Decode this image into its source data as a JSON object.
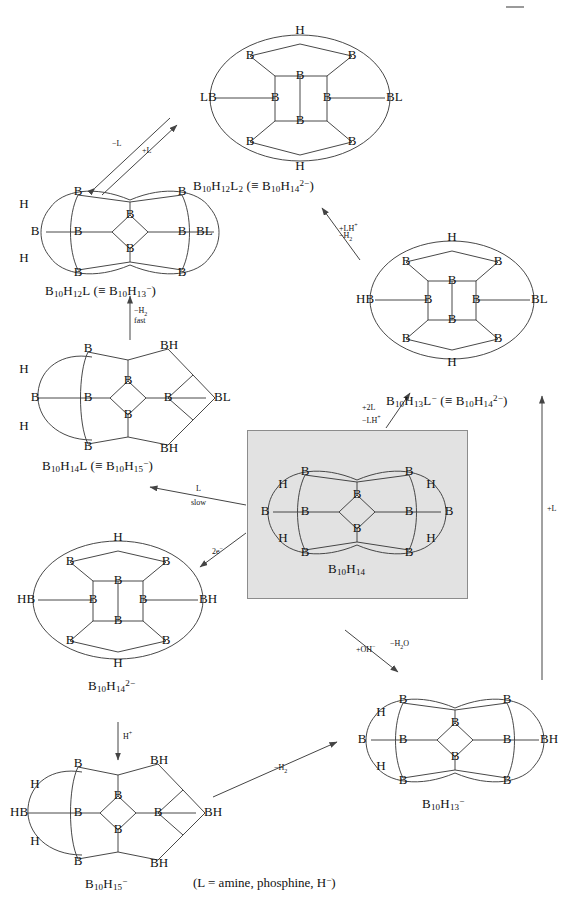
{
  "diagram": {
    "legend": "(L = amine, phosphine, H−)",
    "legend_parts": {
      "prefix": "(L = amine, phosphine, H",
      "sup": "−",
      "suffix": ")"
    },
    "highlight_color": "#e2e2e2",
    "line_color": "#333333",
    "background": "#ffffff"
  },
  "species": [
    {
      "id": "b10h12l2",
      "name": "B10H12L2",
      "label_main": "B₁₀H₁₂L₂",
      "label_equiv": "(≡ B₁₀H₁₄²⁻)",
      "formula_html": "B<sub>10</sub>H<sub>12</sub>L<sub>2</sub> (≡ B<sub>10</sub>H<sub>14</sub><sup>2−</sup>)",
      "cage_type": "ellipse",
      "exterior_atoms": [
        "H",
        "B",
        "B",
        "LB",
        "BL",
        "B",
        "B",
        "H"
      ],
      "x": 193,
      "y": 185
    },
    {
      "id": "b10h12l",
      "name": "B10H12L",
      "formula_html": "B<sub>10</sub>H<sub>12</sub>L (≡ B<sub>10</sub>H<sub>13</sub><sup>−</sup>)",
      "cage_type": "peanut",
      "x": 45,
      "y": 285
    },
    {
      "id": "b10h14l",
      "name": "B10H14L",
      "formula_html": "B<sub>10</sub>H<sub>14</sub>L (≡ B<sub>10</sub>H<sub>15</sub><sup>−</sup>)",
      "cage_type": "peanut-open",
      "x": 42,
      "y": 461
    },
    {
      "id": "b10h14_2minus",
      "name": "B10H14 2-",
      "formula_html": "B<sub>10</sub>H<sub>14</sub><sup>2−</sup>",
      "cage_type": "ellipse",
      "x": 88,
      "y": 652
    },
    {
      "id": "b10h15_minus",
      "name": "B10H15 -",
      "formula_html": "B<sub>10</sub>H<sub>15</sub><sup>−</sup>",
      "cage_type": "peanut-open",
      "x": 85,
      "y": 882
    },
    {
      "id": "b10h14",
      "name": "B10H14",
      "formula_html": "B<sub>10</sub>H<sub>14</sub>",
      "cage_type": "peanut",
      "highlighted": true,
      "x": 336,
      "y": 585
    },
    {
      "id": "b10h13l_minus",
      "name": "B10H13L -",
      "formula_html": "B<sub>10</sub>H<sub>13</sub>L<sup>−</sup> (≡ B<sub>10</sub>H<sub>14</sub><sup>2−</sup>)",
      "cage_type": "ellipse",
      "x": 386,
      "y": 401
    },
    {
      "id": "b10h13_minus",
      "name": "B10H13 -",
      "formula_html": "B<sub>10</sub>H<sub>13</sub><sup>−</sup>",
      "cage_type": "peanut",
      "x": 422,
      "y": 802
    }
  ],
  "arrows": [
    {
      "id": "a1",
      "from": "b10h12l",
      "to": "b10h12l2",
      "type": "double",
      "label_a": "−L",
      "label_b": "+L",
      "label_a_html": "−L",
      "label_b_html": "+L"
    },
    {
      "id": "a2",
      "from": "b10h14l",
      "to": "b10h12l",
      "type": "single",
      "label_a_html": "−H<sub>2</sub>",
      "label_b_html": "fast"
    },
    {
      "id": "a3",
      "from": "b10h13l_minus",
      "to": "b10h12l2",
      "type": "single",
      "label_a_html": "+LH<sup>+</sup>",
      "label_b_html": "−H<sub>2</sub>"
    },
    {
      "id": "a4",
      "from": "b10h14",
      "to": "b10h13l_minus",
      "type": "single",
      "label_a_html": "+2L",
      "label_b_html": "−LH<sup>+</sup>"
    },
    {
      "id": "a5",
      "from": "b10h14",
      "to": "b10h14l",
      "type": "single",
      "label_a_html": "L",
      "label_b_html": "slow"
    },
    {
      "id": "a6",
      "from": "b10h14",
      "to": "b10h14_2minus",
      "type": "single",
      "label_a_html": "2e<sup>−</sup>",
      "label_b_html": ""
    },
    {
      "id": "a7",
      "from": "b10h14_2minus",
      "to": "b10h15_minus",
      "type": "single",
      "label_a_html": "H<sup>+</sup>",
      "label_b_html": ""
    },
    {
      "id": "a8",
      "from": "b10h14",
      "to": "b10h13_minus",
      "type": "single",
      "label_a_html": "+OH<sup>−</sup>",
      "label_b_html": "−H<sub>2</sub>O"
    },
    {
      "id": "a9",
      "from": "b10h15_minus",
      "to": "b10h13_minus",
      "type": "single",
      "label_a_html": "−H<sub>2</sub>",
      "label_b_html": ""
    },
    {
      "id": "a10",
      "from": "b10h13_minus",
      "to": "b10h13l_minus",
      "type": "single",
      "label_a_html": "+L",
      "label_b_html": ""
    }
  ]
}
